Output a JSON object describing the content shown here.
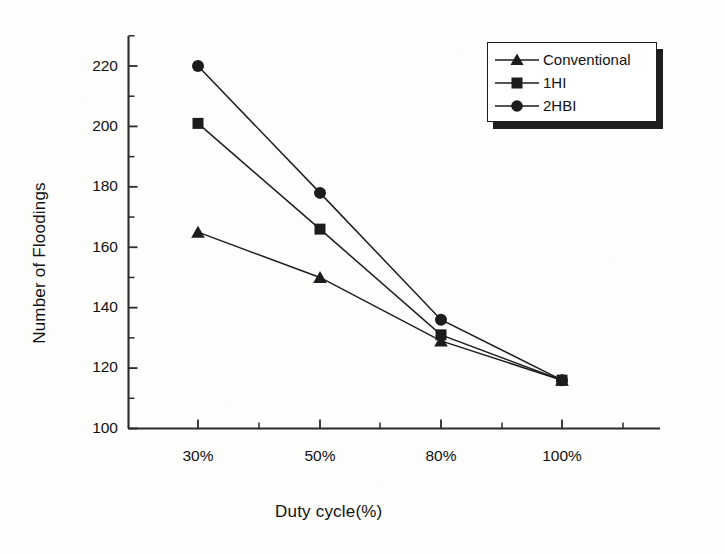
{
  "chart_data": {
    "type": "line",
    "title": "",
    "xlabel": "Duty cycle(%)",
    "ylabel": "Number of Floodings",
    "categories": [
      "30%",
      "50%",
      "80%",
      "100%"
    ],
    "ylim": [
      100,
      230
    ],
    "yticks": [
      100,
      120,
      140,
      160,
      180,
      200,
      220
    ],
    "ytick_labels": [
      "100",
      "120",
      "140",
      "160",
      "180",
      "200",
      "220"
    ],
    "minor_ticks": true,
    "grid": false,
    "legend_position": "top-right",
    "series": [
      {
        "name": "Conventional",
        "marker": "triangle",
        "color": "#1c1c1c",
        "values": [
          165,
          150,
          129,
          116
        ]
      },
      {
        "name": "1HI",
        "marker": "square",
        "color": "#1c1c1c",
        "values": [
          201,
          166,
          131,
          116
        ]
      },
      {
        "name": "2HBI",
        "marker": "circle",
        "color": "#1c1c1c",
        "values": [
          220,
          178,
          136,
          116
        ]
      }
    ]
  },
  "legend": {
    "items": [
      {
        "label": "Conventional",
        "marker": "triangle"
      },
      {
        "label": "1HI",
        "marker": "square"
      },
      {
        "label": "2HBI",
        "marker": "circle"
      }
    ]
  },
  "axes": {
    "y_tick_0": "100",
    "y_tick_1": "120",
    "y_tick_2": "140",
    "y_tick_3": "160",
    "y_tick_4": "180",
    "y_tick_5": "200",
    "y_tick_6": "220",
    "x_tick_0": "30%",
    "x_tick_1": "50%",
    "x_tick_2": "80%",
    "x_tick_3": "100%"
  }
}
